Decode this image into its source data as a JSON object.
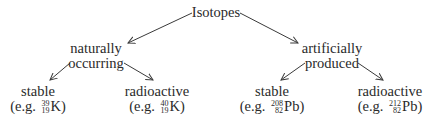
{
  "diagram": {
    "type": "tree",
    "root": {
      "label": "Isotopes"
    },
    "level1": [
      {
        "id": "natural",
        "line1": "naturally",
        "line2": "occurring"
      },
      {
        "id": "artificial",
        "line1": "artificially",
        "line2": "produced"
      }
    ],
    "level2": [
      {
        "parent": "natural",
        "label": "stable",
        "example_prefix": "(e.g. ",
        "mass_number": "39",
        "atomic_number": "19",
        "element": "K",
        "example_suffix": ")"
      },
      {
        "parent": "natural",
        "label": "radioactive",
        "example_prefix": "(e.g. ",
        "mass_number": "40",
        "atomic_number": "19",
        "element": "K",
        "example_suffix": ")"
      },
      {
        "parent": "artificial",
        "label": "stable",
        "example_prefix": "(e.g. ",
        "mass_number": "208",
        "atomic_number": "82",
        "element": "Pb",
        "example_suffix": ")"
      },
      {
        "parent": "artificial",
        "label": "radioactive",
        "example_prefix": "(e.g. ",
        "mass_number": "212",
        "atomic_number": "82",
        "element": "Pb",
        "example_suffix": ")"
      }
    ],
    "edges": [
      {
        "from": "Isotopes",
        "to": "naturally occurring"
      },
      {
        "from": "Isotopes",
        "to": "artificially produced"
      },
      {
        "from": "naturally occurring",
        "to": "stable (e.g. 39/19 K)"
      },
      {
        "from": "naturally occurring",
        "to": "radioactive (e.g. 40/19 K)"
      },
      {
        "from": "artificially produced",
        "to": "stable (e.g. 208/82 Pb)"
      },
      {
        "from": "artificially produced",
        "to": "radioactive (e.g. 212/82 Pb)"
      }
    ]
  }
}
